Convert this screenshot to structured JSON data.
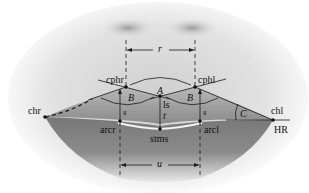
{
  "diagram": {
    "landmarks": {
      "cphr": "cphr",
      "cphl": "cphl",
      "chr": "chr",
      "chl": "chl",
      "arcr": "arcr",
      "arcl": "arcl",
      "stms": "stms",
      "hr": "HR"
    },
    "angles": {
      "a": "A",
      "b_right": "B",
      "b_left": "B",
      "c": "C"
    },
    "measurements": {
      "r": "r",
      "u": "u",
      "ls": "ls",
      "t": "t",
      "s_right": "s",
      "s_left": "s"
    },
    "colors": {
      "line": "#1a1a1a",
      "lip_dark": "#6e6e6e",
      "skin": "#d9d9d9",
      "background": "#ffffff"
    }
  }
}
